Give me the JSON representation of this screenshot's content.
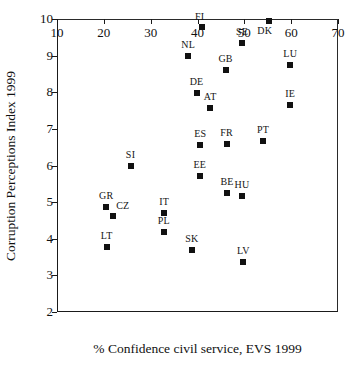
{
  "chart_data": {
    "type": "scatter",
    "title": "",
    "xlabel": "% Confidence civil service, EVS 1999",
    "ylabel": "Corruption Perceptions Index 1999",
    "xlim": [
      10,
      70
    ],
    "ylim": [
      2,
      10
    ],
    "xticks": [
      10,
      20,
      30,
      40,
      50,
      60,
      70
    ],
    "yticks": [
      2,
      3,
      4,
      5,
      6,
      7,
      8,
      9,
      10
    ],
    "grid": false,
    "legend": null,
    "marker": {
      "shape": "square",
      "color": "#111111",
      "size_px": 6
    },
    "points": [
      {
        "label": "FI",
        "x": 41.0,
        "y": 9.77,
        "label_pos": "aboveleft"
      },
      {
        "label": "SE",
        "x": 49.5,
        "y": 9.35,
        "label_pos": "above"
      },
      {
        "label": "DK",
        "x": 55.3,
        "y": 9.95,
        "label_pos": "belowleft"
      },
      {
        "label": "NL",
        "x": 38.0,
        "y": 8.98,
        "label_pos": "above"
      },
      {
        "label": "GB",
        "x": 46.0,
        "y": 8.6,
        "label_pos": "above"
      },
      {
        "label": "LU",
        "x": 59.8,
        "y": 8.75,
        "label_pos": "above"
      },
      {
        "label": "DE",
        "x": 39.8,
        "y": 7.97,
        "label_pos": "above"
      },
      {
        "label": "AT",
        "x": 42.7,
        "y": 7.57,
        "label_pos": "above"
      },
      {
        "label": "IE",
        "x": 59.8,
        "y": 7.66,
        "label_pos": "above"
      },
      {
        "label": "ES",
        "x": 40.6,
        "y": 6.56,
        "label_pos": "above"
      },
      {
        "label": "FR",
        "x": 46.2,
        "y": 6.6,
        "label_pos": "above"
      },
      {
        "label": "PT",
        "x": 54.0,
        "y": 6.68,
        "label_pos": "above"
      },
      {
        "label": "SI",
        "x": 25.7,
        "y": 6.0,
        "label_pos": "above"
      },
      {
        "label": "EE",
        "x": 40.5,
        "y": 5.7,
        "label_pos": "above"
      },
      {
        "label": "BE",
        "x": 46.3,
        "y": 5.26,
        "label_pos": "above"
      },
      {
        "label": "HU",
        "x": 49.5,
        "y": 5.16,
        "label_pos": "above"
      },
      {
        "label": "GR",
        "x": 20.5,
        "y": 4.88,
        "label_pos": "above"
      },
      {
        "label": "CZ",
        "x": 22.0,
        "y": 4.62,
        "label_pos": "aboveright"
      },
      {
        "label": "IT",
        "x": 32.9,
        "y": 4.71,
        "label_pos": "above"
      },
      {
        "label": "PL",
        "x": 32.8,
        "y": 4.19,
        "label_pos": "above"
      },
      {
        "label": "LT",
        "x": 20.6,
        "y": 3.78,
        "label_pos": "above"
      },
      {
        "label": "SK",
        "x": 38.8,
        "y": 3.69,
        "label_pos": "above"
      },
      {
        "label": "LV",
        "x": 49.8,
        "y": 3.37,
        "label_pos": "above"
      }
    ]
  }
}
